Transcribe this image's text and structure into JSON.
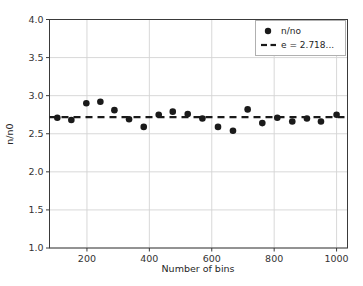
{
  "chart_data": {
    "type": "scatter",
    "title": "",
    "xlabel": "Number of bins",
    "ylabel": "n/n0",
    "xlim": [
      80,
      1035
    ],
    "ylim": [
      1.0,
      4.0
    ],
    "xticks": [
      200,
      400,
      600,
      800,
      1000
    ],
    "xtick_labels": [
      "200",
      "400",
      "600",
      "800",
      "1000"
    ],
    "yticks": [
      1.0,
      1.5,
      2.0,
      2.5,
      3.0,
      3.5,
      4.0
    ],
    "ytick_labels": [
      "1.0",
      "1.5",
      "2.0",
      "2.5",
      "3.0",
      "3.5",
      "4.0"
    ],
    "grid": true,
    "legend_position": "upper right",
    "series": [
      {
        "name": "n/no",
        "type": "scatter",
        "marker": "o",
        "color": "#1a1a1a",
        "x": [
          105,
          150,
          198,
          243,
          288,
          335,
          382,
          430,
          475,
          523,
          570,
          620,
          668,
          715,
          762,
          810,
          858,
          905,
          950,
          1000
        ],
        "y": [
          2.71,
          2.68,
          2.9,
          2.92,
          2.81,
          2.69,
          2.59,
          2.75,
          2.79,
          2.76,
          2.7,
          2.59,
          2.54,
          2.82,
          2.64,
          2.71,
          2.66,
          2.7,
          2.66,
          2.75
        ]
      },
      {
        "name": "e = 2.718...",
        "type": "line",
        "style": "dashed",
        "color": "#1a1a1a",
        "value": 2.718,
        "x": [
          80,
          1035
        ],
        "y": [
          2.718,
          2.718
        ]
      }
    ]
  },
  "legend": {
    "entries": [
      {
        "label": "n/no",
        "marker": "dot"
      },
      {
        "label": "e = 2.718...",
        "marker": "dashed-line"
      }
    ]
  },
  "colors": {
    "data_marker": "#1a1a1a",
    "reference_line": "#1a1a1a",
    "grid": "#d4d4d4",
    "axis": "#3a3a3a",
    "background": "#ffffff",
    "text": "#262626"
  }
}
